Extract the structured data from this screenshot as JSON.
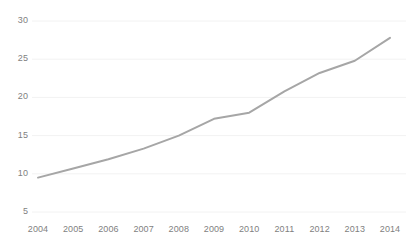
{
  "chart_data": {
    "type": "line",
    "title": "",
    "xlabel": "",
    "ylabel": "",
    "categories": [
      "2004",
      "2005",
      "2006",
      "2007",
      "2008",
      "2009",
      "2010",
      "2011",
      "2012",
      "2013",
      "2014"
    ],
    "x": [
      2004,
      2005,
      2006,
      2007,
      2008,
      2009,
      2010,
      2011,
      2012,
      2013,
      2014
    ],
    "values": [
      9.5,
      10.7,
      11.9,
      13.3,
      15.0,
      17.2,
      18.0,
      20.8,
      23.2,
      24.8,
      27.8
    ],
    "series": [
      {
        "name": "",
        "values": [
          9.5,
          10.7,
          11.9,
          13.3,
          15.0,
          17.2,
          18.0,
          20.8,
          23.2,
          24.8,
          27.8
        ],
        "color": "#a6a6a6"
      }
    ],
    "ylim": [
      5,
      30
    ],
    "yticks": [
      5,
      10,
      15,
      20,
      25,
      30
    ],
    "ytick_labels": [
      "5",
      "10",
      "15",
      "20",
      "25",
      "30"
    ],
    "xtick_labels": [
      "2004",
      "2005",
      "2006",
      "2007",
      "2008",
      "2009",
      "2010",
      "2011",
      "2012",
      "2013",
      "2014"
    ],
    "grid": true,
    "grid_color": "#f2f2f2",
    "legend": false,
    "legend_position": "none",
    "markers": false,
    "line_color": "#a6a6a6",
    "line_width": 2,
    "background": "#ffffff",
    "tick_label_color": "#7f7f7f"
  },
  "axis": {
    "y_ticks": [
      {
        "label": "30",
        "value": 30
      },
      {
        "label": "25",
        "value": 25
      },
      {
        "label": "20",
        "value": 20
      },
      {
        "label": "15",
        "value": 15
      },
      {
        "label": "10",
        "value": 10
      },
      {
        "label": "5",
        "value": 5
      }
    ],
    "x_ticks": [
      {
        "label": "2004"
      },
      {
        "label": "2005"
      },
      {
        "label": "2006"
      },
      {
        "label": "2007"
      },
      {
        "label": "2008"
      },
      {
        "label": "2009"
      },
      {
        "label": "2010"
      },
      {
        "label": "2011"
      },
      {
        "label": "2012"
      },
      {
        "label": "2013"
      },
      {
        "label": "2014"
      }
    ]
  }
}
